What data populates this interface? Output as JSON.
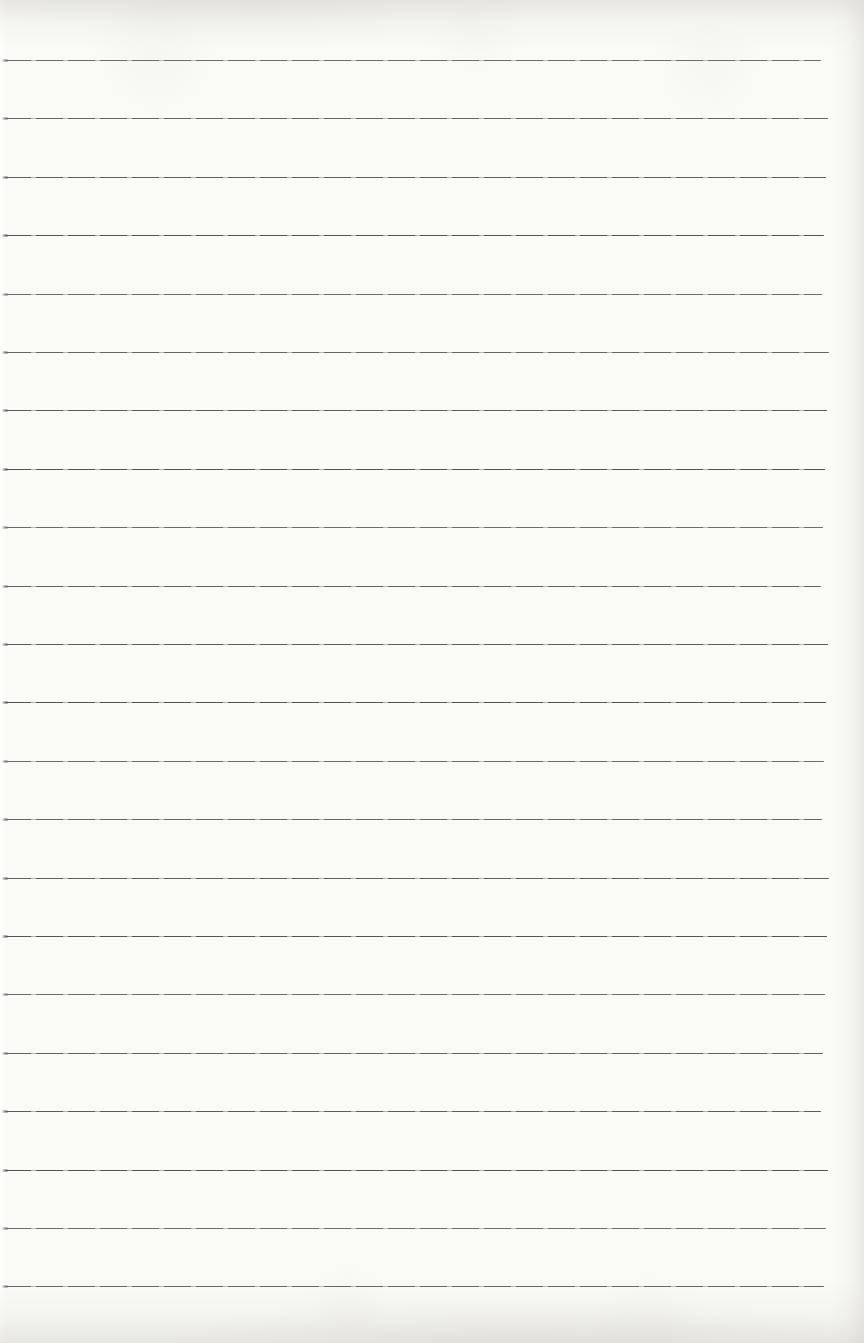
{
  "page": {
    "kind": "blank-ruled-notebook-page",
    "paper_color": "#fafaf7",
    "edge_tint_color": "#d0cec7"
  },
  "ruled_lines": {
    "count": 22,
    "first_line_y": 60,
    "spacing": 58.4,
    "left_x": 4,
    "right_x": 825,
    "thickness": 1,
    "line_color": "#4e4e4e",
    "line_faint_color": "rgba(78,78,78,0.45)"
  }
}
